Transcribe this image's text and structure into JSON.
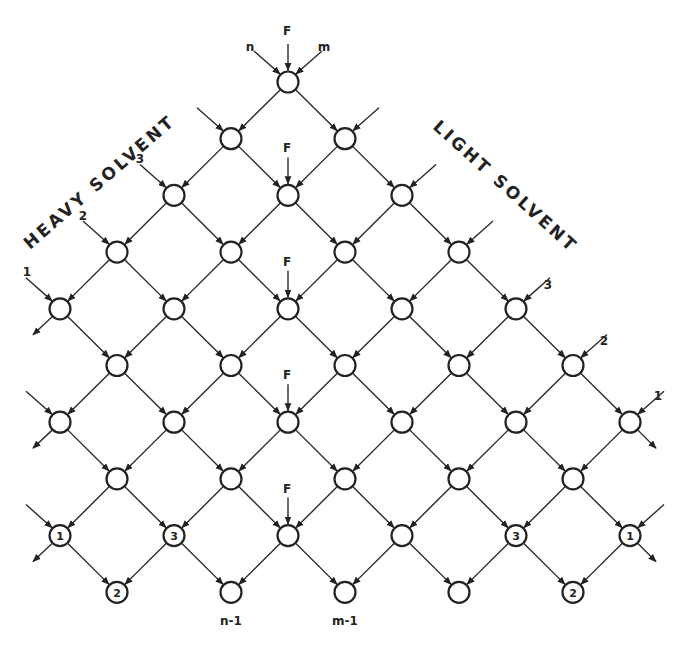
{
  "title_left": "HEAVY SOLVENT",
  "title_right": "LIGHT SOLVENT",
  "top_labels": {
    "feed": "F",
    "n": "n",
    "m": "m"
  },
  "feed_label": "F",
  "left_feed_labels": [
    "1",
    "2",
    "3"
  ],
  "right_feed_labels": [
    "1",
    "2",
    "3"
  ],
  "bottom_labels": {
    "n_minus_1": "n-1",
    "m_minus_1": "m-1"
  },
  "grid": {
    "dx": 57,
    "dy": 56.7,
    "x0": 288,
    "y0": 82,
    "r": 10.5
  },
  "rows": [
    {
      "xs": [
        288
      ]
    },
    {
      "xs": [
        231,
        345
      ]
    },
    {
      "xs": [
        174,
        288,
        402
      ]
    },
    {
      "xs": [
        117,
        231,
        345,
        459
      ]
    },
    {
      "xs": [
        60,
        174,
        288,
        402,
        516
      ]
    },
    {
      "xs": [
        117,
        231,
        345,
        459,
        573
      ]
    },
    {
      "xs": [
        60,
        174,
        288,
        402,
        516,
        630
      ]
    },
    {
      "xs": [
        117,
        231,
        345,
        459,
        573
      ]
    },
    {
      "xs": [
        60,
        174,
        288,
        402,
        516,
        630
      ]
    },
    {
      "xs": [
        117,
        231,
        345,
        459,
        573
      ]
    }
  ],
  "node_labels": [
    {
      "row": 8,
      "x": 60,
      "label": "1"
    },
    {
      "row": 8,
      "x": 174,
      "label": "3"
    },
    {
      "row": 9,
      "x": 117,
      "label": "2"
    },
    {
      "row": 8,
      "x": 516,
      "label": "3"
    },
    {
      "row": 8,
      "x": 630,
      "label": "1"
    },
    {
      "row": 9,
      "x": 573,
      "label": "2"
    }
  ],
  "feed_rows": [
    0,
    2,
    4,
    6,
    8
  ],
  "colors": {
    "line": "#222222",
    "background": "#ffffff"
  }
}
